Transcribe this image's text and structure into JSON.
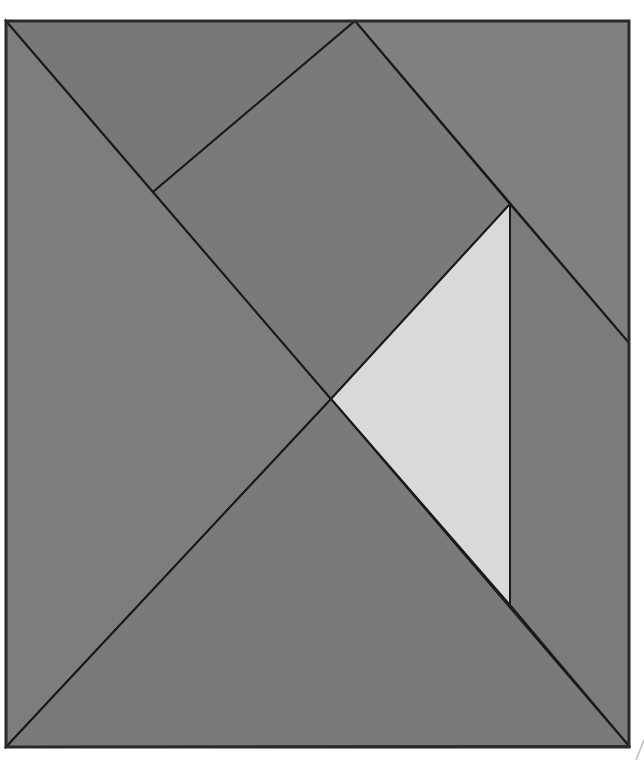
{
  "diagram": {
    "type": "tangram",
    "frame": {
      "x": 6,
      "y": 21,
      "width": 623,
      "height": 726,
      "stroke": "#2a2a2a"
    },
    "pieces": [
      {
        "name": "left-large-triangle",
        "points": [
          [
            6,
            21
          ],
          [
            331,
            399
          ],
          [
            6,
            747
          ]
        ],
        "fill": "#7d7d7d"
      },
      {
        "name": "top-left-triangle",
        "points": [
          [
            6,
            21
          ],
          [
            355,
            21
          ],
          [
            153,
            192
          ]
        ],
        "fill": "#787878"
      },
      {
        "name": "top-right-triangle",
        "points": [
          [
            355,
            21
          ],
          [
            629,
            21
          ],
          [
            629,
            343
          ]
        ],
        "fill": "#808080"
      },
      {
        "name": "center-square",
        "points": [
          [
            153,
            192
          ],
          [
            355,
            21
          ],
          [
            510,
            204
          ],
          [
            331,
            399
          ]
        ],
        "fill": "#7a7a7a"
      },
      {
        "name": "light-center-triangle",
        "points": [
          [
            510,
            204
          ],
          [
            510,
            605
          ],
          [
            331,
            399
          ]
        ],
        "fill": "#d9d9d9"
      },
      {
        "name": "right-parallelogram",
        "points": [
          [
            510,
            204
          ],
          [
            629,
            343
          ],
          [
            629,
            746
          ],
          [
            510,
            605
          ]
        ],
        "fill": "#7b7b7b"
      },
      {
        "name": "bottom-large-triangle",
        "points": [
          [
            6,
            747
          ],
          [
            331,
            399
          ],
          [
            629,
            746
          ]
        ],
        "fill": "#7a7a7a"
      }
    ],
    "artifact": {
      "points": [
        [
          636,
          760
        ],
        [
          644,
          740
        ]
      ]
    }
  }
}
